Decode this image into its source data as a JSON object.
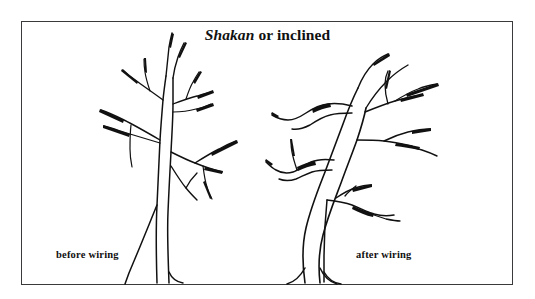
{
  "figure": {
    "title_term": "Shakan",
    "title_rest": " or inclined",
    "caption_left": "before wiring",
    "caption_right": "after wiring",
    "frame_color": "#3a3a3c",
    "ink_color": "#111111",
    "background_color": "#ffffff"
  },
  "illustration": {
    "type": "line-drawing",
    "subject": "bonsai tree styling comparison",
    "left_tree_name": "untrained-tree",
    "right_tree_name": "wired-tree"
  }
}
